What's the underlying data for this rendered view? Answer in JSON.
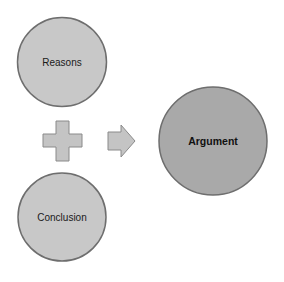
{
  "diagram": {
    "nodes": [
      {
        "id": "reasons",
        "label": "Reasons"
      },
      {
        "id": "conclusion",
        "label": "Conclusion"
      },
      {
        "id": "argument",
        "label": "Argument"
      }
    ],
    "operators": [
      {
        "id": "plus",
        "icon": "plus-icon"
      },
      {
        "id": "arrow",
        "icon": "arrow-right-icon"
      }
    ],
    "colors": {
      "small_circle_fill": "#c8c8c8",
      "large_circle_fill": "#a9a9a9",
      "circle_stroke": "#6e6e6e",
      "shape_fill": "#c4c4c4",
      "shape_stroke": "#8a8a8a"
    }
  }
}
